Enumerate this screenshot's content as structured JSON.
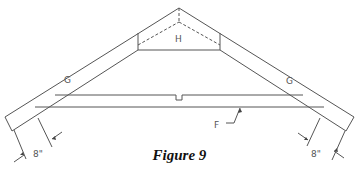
{
  "figure": {
    "caption": "Figure 9",
    "type": "roof truss diagram"
  },
  "labels": {
    "gusset": "H",
    "rafter_left": "G",
    "rafter_right": "G",
    "bottom_chord": "F",
    "overhang_left": "8\"",
    "overhang_right": "8\""
  },
  "colors": {
    "line": "#555555",
    "background": "#ffffff",
    "caption": "#111111"
  }
}
